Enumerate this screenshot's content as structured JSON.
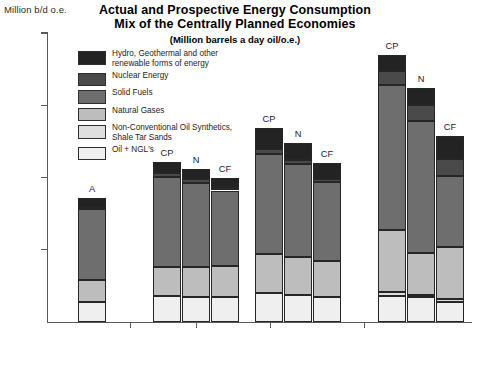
{
  "axis_label": "Million b/d o.e.",
  "title": {
    "line1": "Actual and Prospective Energy Consumption",
    "line2": "Mix of the Centrally Planned Economies",
    "subtitle": "(Million barrels a day oil/o.e.)"
  },
  "legend": [
    {
      "label": "Hydro, Geothermal and other\nrenewable forms of energy",
      "color": "#232323",
      "key": "hydro"
    },
    {
      "label": "Nuclear Energy",
      "color": "#4a4a4a",
      "key": "nuclear"
    },
    {
      "label": "Solid Fuels",
      "color": "#6e6e6e",
      "key": "solid"
    },
    {
      "label": "Natural Gases",
      "color": "#bdbdbd",
      "key": "gas"
    },
    {
      "label": "Non-Conventional Oil Synthetics,\nShale Tar Sands",
      "color": "#dedede",
      "key": "nonconv"
    },
    {
      "label": "Oil + NGL's",
      "color": "#efefef",
      "key": "oil"
    }
  ],
  "yticks": [
    {
      "value": 100,
      "label": "100"
    },
    {
      "value": 75,
      "label": "75"
    },
    {
      "value": 50,
      "label": "50"
    },
    {
      "value": 25,
      "label": "25"
    }
  ],
  "xgroups": [
    {
      "label": "1979"
    },
    {
      "label": "1985"
    },
    {
      "label": "1990"
    },
    {
      "label": "2000"
    }
  ],
  "chart_data": {
    "type": "bar",
    "subtype": "stacked-bar-grouped",
    "title": "Actual and Prospective Energy Consumption Mix of the Centrally Planned Economies",
    "subtitle": "(Million barrels a day oil/o.e.)",
    "xlabel": "",
    "ylabel": "Million b/d o.e.",
    "ylim": [
      0,
      100
    ],
    "yticks": [
      25,
      50,
      75,
      100
    ],
    "grid": false,
    "legend_position": "inside-top-left",
    "series": [
      {
        "name": "Oil + NGL's",
        "color": "#efefef"
      },
      {
        "name": "Non-Conventional Oil Synthetics, Shale Tar Sands",
        "color": "#dedede"
      },
      {
        "name": "Natural Gases",
        "color": "#bdbdbd"
      },
      {
        "name": "Solid Fuels",
        "color": "#6e6e6e"
      },
      {
        "name": "Nuclear Energy",
        "color": "#4a4a4a"
      },
      {
        "name": "Hydro, Geothermal and other renewable forms of energy",
        "color": "#232323"
      }
    ],
    "groups": [
      {
        "year": "1979",
        "bars": [
          {
            "scenario": "A",
            "total": 43.0,
            "values": {
              "oil": 7.0,
              "nonconv": 0.0,
              "gas": 7.5,
              "solid": 24.5,
              "nuclear": 0.5,
              "hydro": 3.5
            }
          }
        ]
      },
      {
        "year": "1985",
        "bars": [
          {
            "scenario": "CP",
            "total": 55.5,
            "values": {
              "oil": 9.0,
              "nonconv": 0.0,
              "gas": 10.0,
              "solid": 31.0,
              "nuclear": 1.5,
              "hydro": 4.0
            }
          },
          {
            "scenario": "N",
            "total": 53.0,
            "values": {
              "oil": 8.5,
              "nonconv": 0.0,
              "gas": 10.5,
              "solid": 29.0,
              "nuclear": 1.5,
              "hydro": 3.5
            }
          },
          {
            "scenario": "CF",
            "total": 50.0,
            "values": {
              "oil": 8.5,
              "nonconv": 0.0,
              "gas": 11.0,
              "solid": 26.0,
              "nuclear": 1.0,
              "hydro": 3.5
            }
          }
        ]
      },
      {
        "year": "1990",
        "bars": [
          {
            "scenario": "CP",
            "total": 67.0,
            "values": {
              "oil": 10.0,
              "nonconv": 0.0,
              "gas": 13.5,
              "solid": 34.5,
              "nuclear": 2.0,
              "hydro": 7.0
            }
          },
          {
            "scenario": "N",
            "total": 62.0,
            "values": {
              "oil": 9.5,
              "nonconv": 0.0,
              "gas": 13.0,
              "solid": 32.0,
              "nuclear": 1.5,
              "hydro": 6.0
            }
          },
          {
            "scenario": "CF",
            "total": 55.0,
            "values": {
              "oil": 8.5,
              "nonconv": 0.0,
              "gas": 12.5,
              "solid": 27.5,
              "nuclear": 1.0,
              "hydro": 5.5
            }
          }
        ]
      },
      {
        "year": "2000",
        "bars": [
          {
            "scenario": "CP",
            "total": 92.5,
            "values": {
              "oil": 9.0,
              "nonconv": 1.5,
              "gas": 21.5,
              "solid": 50.0,
              "nuclear": 5.0,
              "hydro": 5.5
            }
          },
          {
            "scenario": "N",
            "total": 81.0,
            "values": {
              "oil": 8.5,
              "nonconv": 1.0,
              "gas": 14.5,
              "solid": 45.5,
              "nuclear": 5.5,
              "hydro": 6.0
            }
          },
          {
            "scenario": "CF",
            "total": 64.5,
            "values": {
              "oil": 7.0,
              "nonconv": 1.0,
              "gas": 18.0,
              "solid": 24.5,
              "nuclear": 6.0,
              "hydro": 8.0
            }
          }
        ]
      }
    ]
  },
  "geometry": {
    "plot": {
      "left": 47,
      "right": 472,
      "top": 33,
      "bottom": 322,
      "ymax": 100
    },
    "bars": [
      {
        "x": 78,
        "w": 28,
        "group": 0,
        "index": 0
      },
      {
        "x": 153,
        "w": 28,
        "group": 1,
        "index": 0
      },
      {
        "x": 182,
        "w": 28,
        "group": 1,
        "index": 1
      },
      {
        "x": 211,
        "w": 28,
        "group": 1,
        "index": 2
      },
      {
        "x": 255,
        "w": 28,
        "group": 2,
        "index": 0
      },
      {
        "x": 284,
        "w": 28,
        "group": 2,
        "index": 1
      },
      {
        "x": 313,
        "w": 28,
        "group": 2,
        "index": 2
      },
      {
        "x": 378,
        "w": 28,
        "group": 3,
        "index": 0
      },
      {
        "x": 407,
        "w": 28,
        "group": 3,
        "index": 1
      },
      {
        "x": 436,
        "w": 28,
        "group": 3,
        "index": 2
      }
    ],
    "xticks": [
      130,
      196,
      270,
      364
    ],
    "xlabels": [
      {
        "x": 92,
        "label_index": 0
      },
      {
        "x": 196,
        "label_index": 1
      },
      {
        "x": 298,
        "label_index": 2
      },
      {
        "x": 407,
        "label_index": 3
      }
    ]
  }
}
